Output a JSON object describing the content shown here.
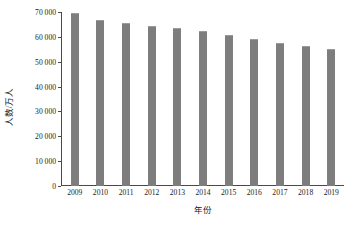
{
  "chart_data": {
    "type": "bar",
    "title": "",
    "xlabel": "年份",
    "ylabel": "人数/万人",
    "categories": [
      "2009",
      "2010",
      "2011",
      "2012",
      "2013",
      "2014",
      "2015",
      "2016",
      "2017",
      "2018",
      "2019"
    ],
    "values": [
      69500,
      66800,
      65400,
      64300,
      63500,
      62400,
      60800,
      59200,
      57500,
      56200,
      55000
    ],
    "series": [
      {
        "name": "人数/万人",
        "values": [
          69500,
          66800,
          65400,
          64300,
          63500,
          62400,
          60800,
          59200,
          57500,
          56200,
          55000
        ]
      }
    ],
    "ylim": [
      0,
      70000
    ],
    "yticks": [
      0,
      10000,
      20000,
      30000,
      40000,
      50000,
      60000,
      70000
    ],
    "ytick_labels": [
      "0",
      "10 000",
      "20 000",
      "30 000",
      "40 000",
      "50 000",
      "60 000",
      "70 000"
    ],
    "grid": false,
    "legend": "none",
    "bar_color": "#7d7d7d",
    "axis_color": "#4a4a4a",
    "text_color": "#1a1a1a"
  }
}
